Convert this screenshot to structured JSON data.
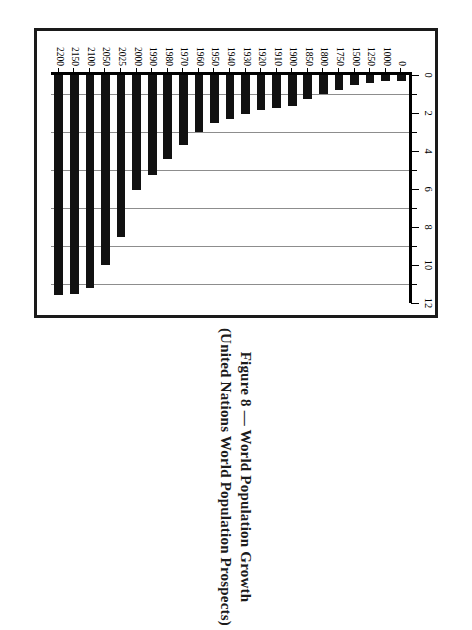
{
  "figure": {
    "title": "Figure 8 — World Population Growth",
    "subtitle": "(United Nations World Population Prospects)"
  },
  "chart_data": {
    "type": "bar",
    "orientation": "horizontal",
    "title": "Figure 8 — World Population Growth",
    "subtitle": "(United Nations World Population Prospects)",
    "xlabel": "",
    "ylabel": "",
    "xlim": [
      0,
      12
    ],
    "grid": "vertical gridlines at odd values 1,3,5,7,9,11",
    "legend": "none",
    "major_ticks": [
      0,
      2,
      4,
      6,
      8,
      10,
      12
    ],
    "minor_ticks": [
      1,
      3,
      5,
      7,
      9,
      11
    ],
    "tick_labels": [
      "0",
      "2",
      "4",
      "6",
      "8",
      "10",
      "12"
    ],
    "categories": [
      "0",
      "1000",
      "1250",
      "1500",
      "1750",
      "1800",
      "1850",
      "1900",
      "1910",
      "1920",
      "1930",
      "1940",
      "1950",
      "1960",
      "1970",
      "1980",
      "1990",
      "2000",
      "2025",
      "2050",
      "2100",
      "2150",
      "2200"
    ],
    "values": [
      0.3,
      0.31,
      0.4,
      0.5,
      0.79,
      0.98,
      1.26,
      1.65,
      1.75,
      1.86,
      2.07,
      2.3,
      2.52,
      3.02,
      3.7,
      4.44,
      5.27,
      6.06,
      8.5,
      9.98,
      11.19,
      11.54,
      11.6
    ],
    "units": "billions of people"
  }
}
